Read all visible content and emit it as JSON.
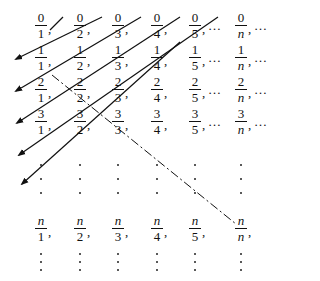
{
  "diagram": {
    "rows": [
      {
        "num": "0",
        "cells": [
          "1",
          "2",
          "3",
          "4",
          "5",
          "n"
        ],
        "trailing": "…"
      },
      {
        "num": "1",
        "cells": [
          "1",
          "2",
          "3",
          "4",
          "5",
          "n"
        ],
        "trailing": "…"
      },
      {
        "num": "2",
        "cells": [
          "1",
          "2",
          "3",
          "4",
          "5",
          "n"
        ],
        "trailing": "…"
      },
      {
        "num": "3",
        "cells": [
          "1",
          "2",
          "3",
          "4",
          "5",
          "n"
        ],
        "trailing": "…"
      },
      {
        "num": "n",
        "cells": [
          "1",
          "2",
          "3",
          "4",
          "5",
          "n"
        ],
        "trailing": ""
      }
    ],
    "ellipsis": "…",
    "comma": ",",
    "column_x": [
      41,
      80,
      118,
      157,
      195,
      241
    ],
    "row_bar_y": [
      25,
      57,
      89,
      121,
      228
    ],
    "vertical_dot_rows_y": [
      165,
      179,
      193
    ],
    "bottom_dot_rows_y": [
      254,
      262,
      270
    ],
    "diagonals": [
      {
        "x1": 50,
        "y1": 30,
        "x2": 63,
        "y2": 17,
        "arrow": false
      },
      {
        "x1": 102,
        "y1": 17,
        "x2": 16,
        "y2": 59,
        "arrow": true
      },
      {
        "x1": 141,
        "y1": 17,
        "x2": 16,
        "y2": 91,
        "arrow": true
      },
      {
        "x1": 180,
        "y1": 17,
        "x2": 17,
        "y2": 123,
        "arrow": true
      },
      {
        "x1": 218,
        "y1": 17,
        "x2": 19,
        "y2": 155,
        "arrow": true
      },
      {
        "x1": 180,
        "y1": 42,
        "x2": 22,
        "y2": 184,
        "arrow": true
      }
    ],
    "dashed_diagonal": {
      "x1": 52,
      "y1": 75,
      "x2": 236,
      "y2": 224
    },
    "colors": {
      "ink": "#111111",
      "background": "#ffffff"
    }
  }
}
